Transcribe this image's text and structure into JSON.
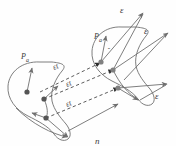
{
  "figure": {
    "type": "vector-field-diagram",
    "background_color": "#fefefe",
    "stroke_color": "#6b6b6b",
    "dash_color": "#4a4a4a",
    "node_color": "#555555",
    "text_color": "#3a3a3a"
  },
  "labels": {
    "epsilon": "ε",
    "epsilon_t": "εt",
    "p_vector": "P",
    "p_subscript": "a",
    "n_hat": "n",
    "hat_mark": "ˆ"
  },
  "elements": {
    "epsilon_top_right": "ε",
    "epsilon_mid_right": "ε",
    "epsilon_bottom_right": "ε",
    "epsilon_t_upper": "εt",
    "epsilon_t_middle": "εt",
    "epsilon_t_lower": "εt",
    "p_hat_a_left": "P",
    "p_hat_a_right": "P",
    "n_hat_label": "n"
  },
  "geometry": {
    "left_blob_center_x": 40,
    "left_blob_center_y": 92,
    "right_blob_center_x": 122,
    "right_blob_center_y": 55,
    "dashed_vector_count": 3,
    "node_count": 6
  }
}
